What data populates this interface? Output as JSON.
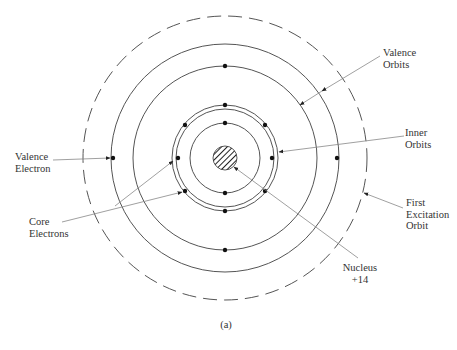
{
  "figure": {
    "caption": "(a)",
    "center": [
      225,
      158
    ],
    "colors": {
      "stroke": "#555555",
      "electron": "#111111",
      "leader": "#888888",
      "text": "#333333"
    }
  },
  "labels": {
    "valence_electron": {
      "line1": "Valence",
      "line2": "Electron"
    },
    "core_electrons": {
      "line1": "Core",
      "line2": "Electrons"
    },
    "valence_orbits": {
      "line1": "Valence",
      "line2": "Orbits"
    },
    "inner_orbits": {
      "line1": "Inner",
      "line2": "Orbits"
    },
    "first_excitation_orbit": {
      "line1": "First",
      "line2": "Excitation",
      "line3": "Orbit"
    },
    "nucleus": {
      "line1": "Nucleus",
      "line2": "+14"
    }
  },
  "orbits": [
    {
      "name": "innermost-orbit",
      "r": 35,
      "style": "solid"
    },
    {
      "name": "inner-double-ring-inner",
      "r": 49,
      "style": "solid"
    },
    {
      "name": "inner-double-ring-outer",
      "r": 53,
      "style": "solid"
    },
    {
      "name": "valence-orbit-inner",
      "r": 92,
      "style": "solid"
    },
    {
      "name": "valence-orbit-outer",
      "r": 114,
      "style": "solid"
    },
    {
      "name": "first-excitation-orbit",
      "r": 142,
      "style": "dashed"
    }
  ],
  "nucleus": {
    "r": 12,
    "charge": "+14"
  }
}
